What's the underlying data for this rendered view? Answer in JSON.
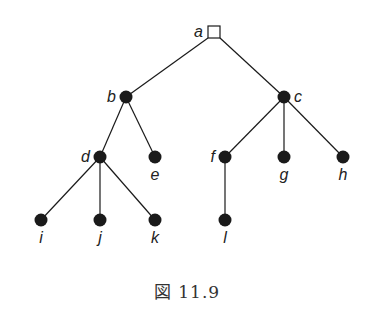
{
  "diagram": {
    "type": "rooted-tree",
    "root": "a",
    "nodes": [
      {
        "id": "a",
        "label": "a",
        "x": 214,
        "y": 32,
        "shape": "square",
        "label_pos": "left"
      },
      {
        "id": "b",
        "label": "b",
        "x": 126,
        "y": 97,
        "shape": "dot",
        "label_pos": "left"
      },
      {
        "id": "c",
        "label": "c",
        "x": 284,
        "y": 97,
        "shape": "dot",
        "label_pos": "right"
      },
      {
        "id": "d",
        "label": "d",
        "x": 100,
        "y": 157,
        "shape": "dot",
        "label_pos": "left"
      },
      {
        "id": "e",
        "label": "e",
        "x": 155,
        "y": 157,
        "shape": "dot",
        "label_pos": "below"
      },
      {
        "id": "f",
        "label": "f",
        "x": 225,
        "y": 157,
        "shape": "dot",
        "label_pos": "left"
      },
      {
        "id": "g",
        "label": "g",
        "x": 284,
        "y": 157,
        "shape": "dot",
        "label_pos": "below"
      },
      {
        "id": "h",
        "label": "h",
        "x": 343,
        "y": 157,
        "shape": "dot",
        "label_pos": "below"
      },
      {
        "id": "i",
        "label": "i",
        "x": 41,
        "y": 220,
        "shape": "dot",
        "label_pos": "below"
      },
      {
        "id": "j",
        "label": "j",
        "x": 100,
        "y": 220,
        "shape": "dot",
        "label_pos": "below"
      },
      {
        "id": "k",
        "label": "k",
        "x": 155,
        "y": 220,
        "shape": "dot",
        "label_pos": "below"
      },
      {
        "id": "l",
        "label": "l",
        "x": 225,
        "y": 220,
        "shape": "dot",
        "label_pos": "below"
      }
    ],
    "edges": [
      [
        "a",
        "b"
      ],
      [
        "a",
        "c"
      ],
      [
        "b",
        "d"
      ],
      [
        "b",
        "e"
      ],
      [
        "c",
        "f"
      ],
      [
        "c",
        "g"
      ],
      [
        "c",
        "h"
      ],
      [
        "d",
        "i"
      ],
      [
        "d",
        "j"
      ],
      [
        "d",
        "k"
      ],
      [
        "f",
        "l"
      ]
    ],
    "colors": {
      "stroke": "#1a1a1a",
      "node_fill": "#1a1a1a",
      "root_fill": "#ffffff"
    }
  },
  "caption": "図 11.9"
}
